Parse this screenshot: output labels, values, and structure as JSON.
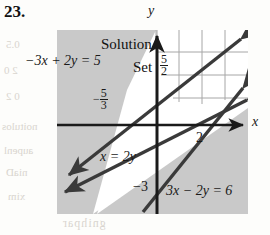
{
  "exercise": {
    "number": "23."
  },
  "figure": {
    "type": "inequality-system-graph",
    "shading_color": "#c9c9c9",
    "solution_region_color": "#ffffff",
    "line_color": "#3a3a3a",
    "grid_color": "#9a9a9a",
    "axis_color": "#1a1a1a",
    "axes": {
      "x_label": "x",
      "y_label": "y"
    },
    "solution_label": {
      "line1": "Solution",
      "line2": "Set"
    },
    "boundary_lines": [
      {
        "id": "line-1",
        "equation_label": "−3x + 2y = 5",
        "y_intercept_label": "5",
        "x_intercept_label_num": "5",
        "x_intercept_label_den": "3",
        "x_intercept_sign": "−"
      },
      {
        "id": "line-2",
        "equation_label": "3x − 2y = 6",
        "x_intercept_label": "2",
        "y_intercept_label": "−3"
      },
      {
        "id": "line-3",
        "equation_label": "x = 2y"
      }
    ],
    "tick_labels": {
      "y_five": "5",
      "y_five_halves_num": "5",
      "y_five_halves_den": "2",
      "x_two": "2",
      "y_neg_three": "−3"
    }
  },
  "background_bleed": [
    {
      "text": "0.5",
      "x": 6,
      "y": 44
    },
    {
      "text": "2 0",
      "x": 4,
      "y": 70
    },
    {
      "text": "0 2",
      "x": 6,
      "y": 96
    },
    {
      "text": "noitulos",
      "x": 2,
      "y": 126
    },
    {
      "text": "aupenl",
      "x": 4,
      "y": 150
    },
    {
      "text": "niaD",
      "x": 6,
      "y": 172
    },
    {
      "text": "xim",
      "x": 8,
      "y": 196
    }
  ]
}
